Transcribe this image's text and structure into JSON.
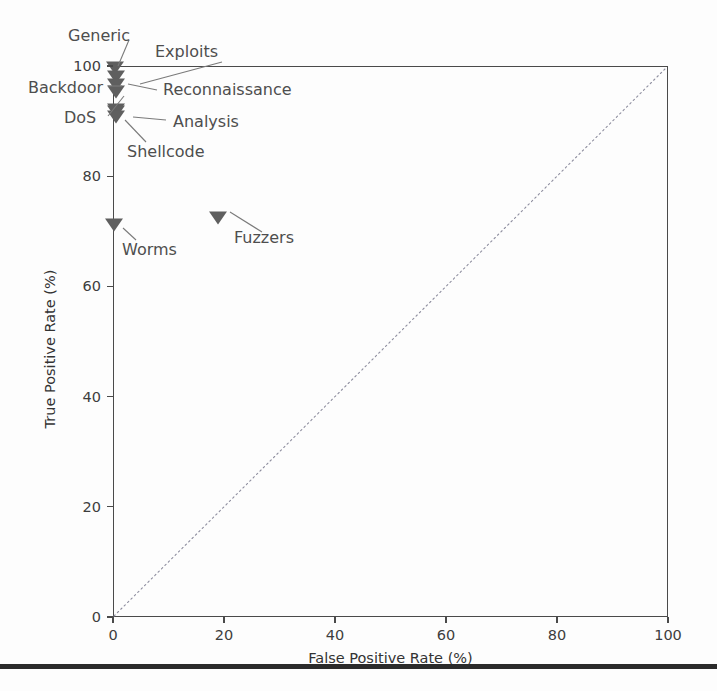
{
  "chart_data": {
    "type": "scatter",
    "title": "",
    "xlabel": "False Positive Rate (%)",
    "ylabel": "True Positive Rate (%)",
    "xlim": [
      0,
      100
    ],
    "ylim": [
      0,
      100
    ],
    "xticks": [
      0,
      20,
      40,
      60,
      80,
      100
    ],
    "yticks": [
      0,
      20,
      40,
      60,
      80,
      100
    ],
    "xticklabels": [
      "0",
      "20",
      "40",
      "60",
      "80",
      "100"
    ],
    "yticklabels": [
      "0",
      "20",
      "40",
      "60",
      "80",
      "100"
    ],
    "grid": false,
    "legend": false,
    "marker_style": "triangle-down",
    "marker_color": "#5f5f5f",
    "reference_line": {
      "name": "chance-diagonal",
      "style": "dotted",
      "color": "#8d8d9e",
      "from": [
        0,
        0
      ],
      "to": [
        100,
        100
      ]
    },
    "points": [
      {
        "label": "Generic",
        "x": 0.4,
        "y": 99.6
      },
      {
        "label": "Exploits",
        "x": 0.6,
        "y": 98.0
      },
      {
        "label": "Reconnaissance",
        "x": 0.5,
        "y": 96.5
      },
      {
        "label": "Backdoor",
        "x": 0.5,
        "y": 95.2
      },
      {
        "label": "DoS",
        "x": 0.5,
        "y": 92.0
      },
      {
        "label": "Analysis",
        "x": 0.6,
        "y": 91.6
      },
      {
        "label": "Shellcode",
        "x": 0.5,
        "y": 90.8
      },
      {
        "label": "Worms",
        "x": 0.2,
        "y": 71.2
      },
      {
        "label": "Fuzzers",
        "x": 19.0,
        "y": 72.4
      }
    ]
  },
  "annotations": {
    "generic": "Generic",
    "exploits": "Exploits",
    "reconnaissance": "Reconnaissance",
    "backdoor": "Backdoor",
    "dos": "DoS",
    "analysis": "Analysis",
    "shellcode": "Shellcode",
    "worms": "Worms",
    "fuzzers": "Fuzzers"
  },
  "axes": {
    "x_title": "False Positive Rate (%)",
    "y_title": "True Positive Rate (%)",
    "x_tick_labels": [
      "0",
      "20",
      "40",
      "60",
      "80",
      "100"
    ],
    "y_tick_labels": [
      "0",
      "20",
      "40",
      "60",
      "80",
      "100"
    ]
  }
}
